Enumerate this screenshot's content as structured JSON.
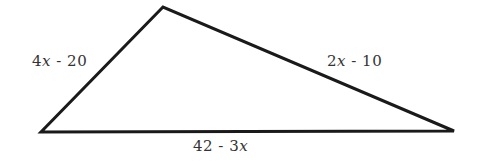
{
  "diagram": {
    "type": "triangle",
    "vertices": {
      "top": [
        163,
        7
      ],
      "left": [
        41,
        132
      ],
      "right": [
        454,
        131
      ]
    },
    "sides": [
      {
        "id": "left-side",
        "label_coef": "4",
        "label_var": "x",
        "label_rest": " - 20",
        "full": "4x - 20"
      },
      {
        "id": "right-side",
        "label_coef": "2",
        "label_var": "x",
        "label_rest": " - 10",
        "full": "2x - 10"
      },
      {
        "id": "bottom-side",
        "label_coef": "42 - 3",
        "label_var": "x",
        "label_rest": "",
        "full": "42 - 3x"
      }
    ],
    "stroke_color": "#1a1a1a",
    "label_color": "#333333"
  }
}
